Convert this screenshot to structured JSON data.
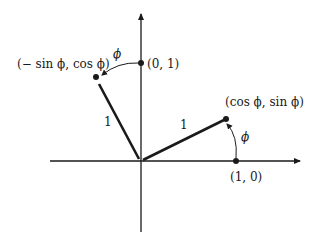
{
  "diagram": {
    "type": "unit-vector-rotation",
    "axes": {
      "x_axis": "horizontal",
      "y_axis": "vertical"
    },
    "points": {
      "unit_y": {
        "label": "(0, 1)"
      },
      "unit_x": {
        "label": "(1, 0)"
      },
      "rotated_x": {
        "label": "(cos ϕ, sin ϕ)"
      },
      "rotated_y": {
        "label": "(− sin ϕ, cos ϕ)"
      }
    },
    "segments": {
      "rotated_x_length": "1",
      "rotated_y_length": "1"
    },
    "angles": {
      "arc_x": "ϕ",
      "arc_y": "ϕ"
    },
    "colors": {
      "stroke": "#1a1a1a",
      "background": "#ffffff"
    }
  }
}
